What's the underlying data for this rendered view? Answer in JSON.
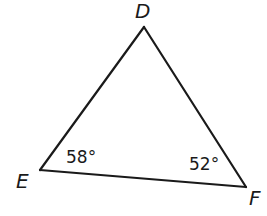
{
  "figure": {
    "type": "triangle",
    "name": "Triangle DEF",
    "vertices": {
      "D": {
        "label": "D"
      },
      "E": {
        "label": "E"
      },
      "F": {
        "label": "F"
      }
    },
    "sides": [
      "DE",
      "EF",
      "FD"
    ],
    "angles": {
      "E": {
        "label": "58°",
        "degrees": 58
      },
      "F": {
        "label": "52°",
        "degrees": 52
      }
    },
    "line_color": "#1a1a1a",
    "background_color": "#ffffff"
  }
}
